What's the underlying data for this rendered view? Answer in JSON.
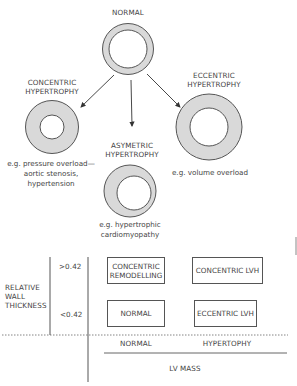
{
  "diagram": {
    "top": {
      "normal_label": "NORMAL",
      "concentric_label_1": "CONCENTRIC",
      "concentric_label_2": "HYPERTROPHY",
      "eccentric_label_1": "ECCENTRIC",
      "eccentric_label_2": "HYPERTROPHY",
      "asymmetric_label_1": "ASYMETRIC",
      "asymmetric_label_2": "HYPERTROPHY",
      "concentric_caption_1": "e.g. pressure overload—",
      "concentric_caption_2": "aortic stenosis,",
      "concentric_caption_3": "hypertension",
      "eccentric_caption": "e.g. volume overload",
      "asymmetric_caption_1": "e.g. hypertrophic",
      "asymmetric_caption_2": "cardiomyopathy"
    },
    "colors": {
      "ring_fill": "#d9d9d9",
      "stroke": "#555555",
      "background": "#ffffff"
    },
    "grid": {
      "y_axis_label_1": "RELATIVE",
      "y_axis_label_2": "WALL",
      "y_axis_label_3": "THICKNESS",
      "y_high": ">0.42",
      "y_low": "<0.42",
      "x_normal": "NORMAL",
      "x_hyper": "HYPERTOPHY",
      "x_axis_label": "LV MASS",
      "cells": {
        "top_left_1": "CONCENTRIC",
        "top_left_2": "REMODELLING",
        "top_right": "CONCENTRIC LVH",
        "bottom_left": "NORMAL",
        "bottom_right": "ECCENTRIC LVH"
      }
    }
  }
}
